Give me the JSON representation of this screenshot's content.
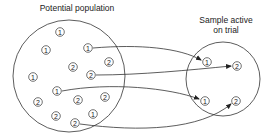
{
  "diagram": {
    "population": {
      "label": "Potential population",
      "circle": {
        "cx": 69,
        "cy": 76,
        "r": 56
      },
      "nodes": [
        {
          "id": "p1",
          "value": "1",
          "x": 60,
          "y": 32
        },
        {
          "id": "p2",
          "value": "1",
          "x": 46,
          "y": 50
        },
        {
          "id": "p3",
          "value": "1",
          "x": 88,
          "y": 48
        },
        {
          "id": "p4",
          "value": "2",
          "x": 109,
          "y": 62
        },
        {
          "id": "p5",
          "value": "2",
          "x": 73,
          "y": 67
        },
        {
          "id": "p6",
          "value": "2",
          "x": 91,
          "y": 75
        },
        {
          "id": "p7",
          "value": "1",
          "x": 33,
          "y": 77
        },
        {
          "id": "p8",
          "value": "1",
          "x": 57,
          "y": 91
        },
        {
          "id": "p9",
          "value": "2",
          "x": 38,
          "y": 102
        },
        {
          "id": "p10",
          "value": "2",
          "x": 78,
          "y": 100
        },
        {
          "id": "p11",
          "value": "2",
          "x": 105,
          "y": 97
        },
        {
          "id": "p12",
          "value": "2",
          "x": 56,
          "y": 116
        },
        {
          "id": "p13",
          "value": "1",
          "x": 93,
          "y": 114
        },
        {
          "id": "p14",
          "value": "2",
          "x": 75,
          "y": 123
        }
      ]
    },
    "sample": {
      "label": "Sample active on trial",
      "label_lines": [
        "Sample active",
        "on trial"
      ],
      "circle": {
        "cx": 223,
        "cy": 79,
        "r": 37
      },
      "nodes": [
        {
          "id": "s1",
          "value": "1",
          "x": 207,
          "y": 62
        },
        {
          "id": "s2",
          "value": "2",
          "x": 237,
          "y": 66
        },
        {
          "id": "s3",
          "value": "1",
          "x": 205,
          "y": 101
        },
        {
          "id": "s4",
          "value": "2",
          "x": 236,
          "y": 101
        }
      ]
    },
    "arrows": [
      {
        "from": "p3",
        "to": "s1",
        "path": "M93,48 C140,44 180,48 201,60"
      },
      {
        "from": "p6",
        "to": "s2",
        "path": "M96,75 C140,75 190,70 231,66"
      },
      {
        "from": "p8",
        "to": "s3",
        "path": "M62,91 C110,82 170,88 199,99"
      },
      {
        "from": "p14",
        "to": "s4",
        "path": "M80,124 C140,132 200,130 231,104"
      }
    ],
    "colors": {
      "stroke": "#333333",
      "text": "#222222",
      "background": "#ffffff"
    }
  }
}
